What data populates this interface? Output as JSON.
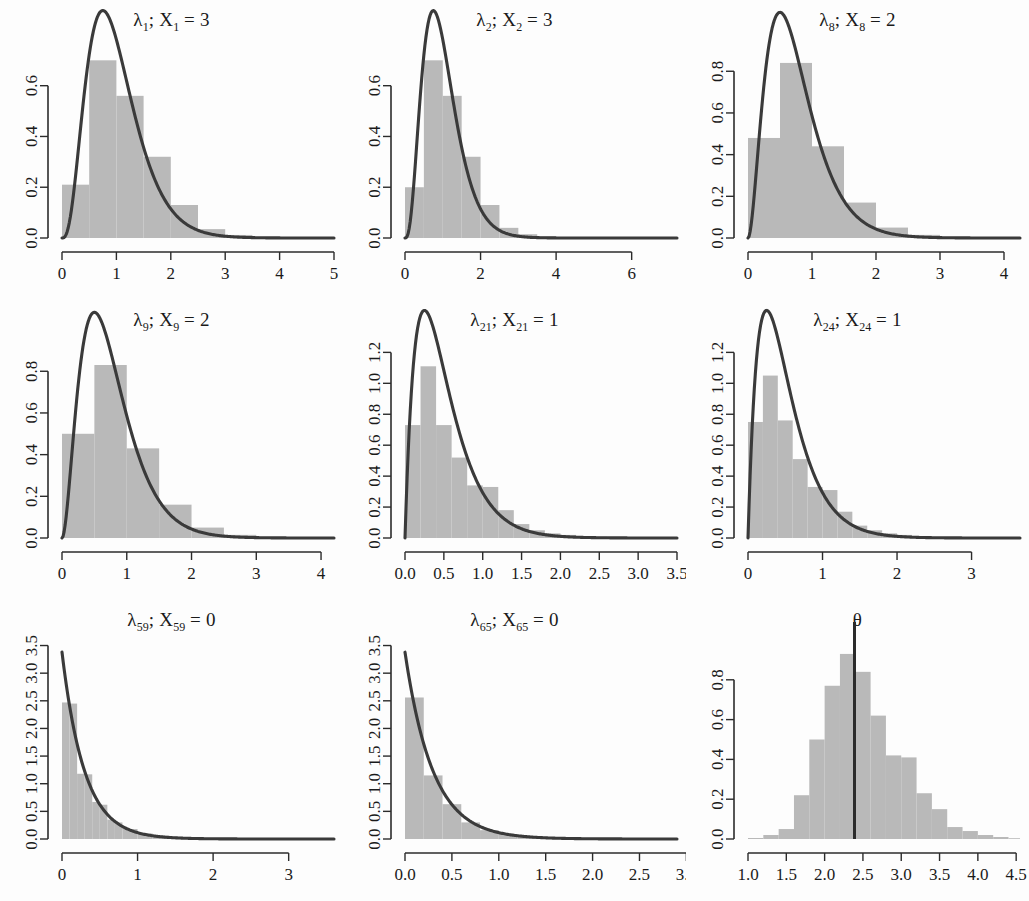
{
  "figure": {
    "title": "",
    "rows": 3,
    "cols": 3,
    "background_color": "#fdfdfd",
    "bar_fill_color": "#b9b9b9",
    "curve_color": "#3a3a3a",
    "axis_color": "#2b2b2b"
  },
  "panels": [
    {
      "id": "panel-lambda-1",
      "title_symbol": "λ",
      "title_sub1": "1",
      "title_var": "X",
      "title_sub2": "1",
      "title_value": "3",
      "title_text": "λ1; X1 = 3"
    },
    {
      "id": "panel-lambda-2",
      "title_symbol": "λ",
      "title_sub1": "2",
      "title_var": "X",
      "title_sub2": "2",
      "title_value": "3",
      "title_text": "λ2; X2 = 3"
    },
    {
      "id": "panel-lambda-8",
      "title_symbol": "λ",
      "title_sub1": "8",
      "title_var": "X",
      "title_sub2": "8",
      "title_value": "2",
      "title_text": "λ8; X8 = 2"
    },
    {
      "id": "panel-lambda-9",
      "title_symbol": "λ",
      "title_sub1": "9",
      "title_var": "X",
      "title_sub2": "9",
      "title_value": "2",
      "title_text": "λ9; X9 = 2"
    },
    {
      "id": "panel-lambda-21",
      "title_symbol": "λ",
      "title_sub1": "21",
      "title_var": "X",
      "title_sub2": "21",
      "title_value": "1",
      "title_text": "λ21; X21 = 1"
    },
    {
      "id": "panel-lambda-24",
      "title_symbol": "λ",
      "title_sub1": "24",
      "title_var": "X",
      "title_sub2": "24",
      "title_value": "1",
      "title_text": "λ24; X24 = 1"
    },
    {
      "id": "panel-lambda-59",
      "title_symbol": "λ",
      "title_sub1": "59",
      "title_var": "X",
      "title_sub2": "59",
      "title_value": "0",
      "title_text": "λ59; X59 = 0"
    },
    {
      "id": "panel-lambda-65",
      "title_symbol": "λ",
      "title_sub1": "65",
      "title_var": "X",
      "title_sub2": "65",
      "title_value": "0",
      "title_text": "λ65; X65 = 0"
    },
    {
      "id": "panel-theta",
      "title_symbol": "θ",
      "title_sub1": "",
      "title_var": "",
      "title_sub2": "",
      "title_value": "",
      "title_text": "θ"
    }
  ],
  "chart_data": [
    {
      "type": "bar",
      "id": "panel-lambda-1",
      "title": "λ1; X1 = 3",
      "xlabel": "",
      "ylabel": "",
      "xlim": [
        0,
        5.0
      ],
      "ylim": [
        0,
        0.78
      ],
      "xticks": [
        0,
        1,
        2,
        3,
        4,
        5
      ],
      "xticklabels": [
        "0",
        "1",
        "2",
        "3",
        "4",
        "5"
      ],
      "yticks": [
        0.0,
        0.2,
        0.4,
        0.6
      ],
      "yticklabels": [
        "0.0",
        "0.2",
        "0.4",
        "0.6"
      ],
      "grid": false,
      "bin_edges": [
        0.0,
        0.5,
        1.0,
        1.5,
        2.0,
        2.5,
        3.0,
        3.5,
        4.0,
        4.5,
        5.0
      ],
      "values": [
        0.21,
        0.7,
        0.56,
        0.32,
        0.13,
        0.035,
        0.012,
        0.004,
        0.001,
        0.0
      ],
      "overlay": {
        "name": "gamma density",
        "type": "line",
        "shape": 4,
        "rate": 4,
        "peak_x": 0.86,
        "peak_y": 0.75
      }
    },
    {
      "type": "bar",
      "id": "panel-lambda-2",
      "title": "λ2; X2 = 3",
      "xlabel": "",
      "ylabel": "",
      "xlim": [
        0,
        7.2
      ],
      "ylim": [
        0,
        0.78
      ],
      "xticks": [
        0,
        2,
        4,
        6
      ],
      "xticklabels": [
        "0",
        "2",
        "4",
        "6"
      ],
      "yticks": [
        0.0,
        0.2,
        0.4,
        0.6
      ],
      "yticklabels": [
        "0.0",
        "0.2",
        "0.4",
        "0.6"
      ],
      "grid": false,
      "bin_edges": [
        0.0,
        0.5,
        1.0,
        1.5,
        2.0,
        2.5,
        3.0,
        3.5,
        4.0,
        4.5,
        5.0,
        5.5,
        6.0,
        6.5,
        7.0
      ],
      "values": [
        0.2,
        0.7,
        0.56,
        0.32,
        0.13,
        0.04,
        0.015,
        0.006,
        0.002,
        0.001,
        0.0,
        0.0,
        0.0,
        0.0
      ],
      "overlay": {
        "name": "gamma density",
        "type": "line",
        "shape": 4,
        "rate": 4,
        "peak_x": 0.88,
        "peak_y": 0.75
      }
    },
    {
      "type": "bar",
      "id": "panel-lambda-8",
      "title": "λ8; X8 = 2",
      "xlabel": "",
      "ylabel": "",
      "xlim": [
        0,
        4.25
      ],
      "ylim": [
        0,
        0.95
      ],
      "xticks": [
        0,
        1,
        2,
        3,
        4
      ],
      "xticklabels": [
        "0",
        "1",
        "2",
        "3",
        "4"
      ],
      "yticks": [
        0.0,
        0.2,
        0.4,
        0.6,
        0.8
      ],
      "yticklabels": [
        "0.0",
        "0.2",
        "0.4",
        "0.6",
        "0.8"
      ],
      "grid": false,
      "bin_edges": [
        0.0,
        0.5,
        1.0,
        1.5,
        2.0,
        2.5,
        3.0,
        3.5,
        4.0,
        4.25
      ],
      "values": [
        0.48,
        0.84,
        0.44,
        0.17,
        0.05,
        0.015,
        0.005,
        0.001,
        0.0
      ],
      "overlay": {
        "name": "gamma density",
        "type": "line",
        "shape": 3,
        "rate": 4,
        "peak_x": 0.58,
        "peak_y": 0.92
      }
    },
    {
      "type": "bar",
      "id": "panel-lambda-9",
      "title": "λ9; X9 = 2",
      "xlabel": "",
      "ylabel": "",
      "xlim": [
        0,
        4.2
      ],
      "ylim": [
        0,
        0.95
      ],
      "xticks": [
        0,
        1,
        2,
        3,
        4
      ],
      "xticklabels": [
        "0",
        "1",
        "2",
        "3",
        "4"
      ],
      "yticks": [
        0.0,
        0.2,
        0.4,
        0.6,
        0.8
      ],
      "yticklabels": [
        "0.0",
        "0.2",
        "0.4",
        "0.6",
        "0.8"
      ],
      "grid": false,
      "bin_edges": [
        0.0,
        0.5,
        1.0,
        1.5,
        2.0,
        2.5,
        3.0,
        3.5,
        4.0,
        4.2
      ],
      "values": [
        0.5,
        0.83,
        0.43,
        0.16,
        0.05,
        0.015,
        0.004,
        0.001,
        0.0
      ],
      "overlay": {
        "name": "gamma density",
        "type": "line",
        "shape": 3,
        "rate": 4,
        "peak_x": 0.6,
        "peak_y": 0.92
      }
    },
    {
      "type": "bar",
      "id": "panel-lambda-21",
      "title": "λ21; X21 = 1",
      "xlabel": "",
      "ylabel": "",
      "xlim": [
        0,
        3.5
      ],
      "ylim": [
        0,
        1.28
      ],
      "xticks": [
        0.0,
        0.5,
        1.0,
        1.5,
        2.0,
        2.5,
        3.0,
        3.5
      ],
      "xticklabels": [
        "0.0",
        "0.5",
        "1.0",
        "1.5",
        "2.0",
        "2.5",
        "3.0",
        "3.5"
      ],
      "yticks": [
        0.0,
        0.2,
        0.4,
        0.6,
        0.8,
        1.0,
        1.2
      ],
      "yticklabels": [
        "0.0",
        "0.2",
        "0.4",
        "0.6",
        "0.8",
        "1.0",
        "1.2"
      ],
      "grid": false,
      "bin_edges": [
        0.0,
        0.2,
        0.4,
        0.6,
        0.8,
        1.0,
        1.2,
        1.4,
        1.6,
        1.8,
        2.0,
        2.2,
        2.4,
        2.6,
        2.8,
        3.0,
        3.2
      ],
      "values": [
        0.73,
        1.11,
        0.73,
        0.52,
        0.34,
        0.33,
        0.18,
        0.09,
        0.05,
        0.03,
        0.02,
        0.01,
        0.008,
        0.004,
        0.002,
        0.001
      ],
      "overlay": {
        "name": "gamma density",
        "type": "line",
        "shape": 2,
        "rate": 4,
        "peak_x": 0.31,
        "peak_y": 1.24
      }
    },
    {
      "type": "bar",
      "id": "panel-lambda-24",
      "title": "λ24; X24 = 1",
      "xlabel": "",
      "ylabel": "",
      "xlim": [
        0,
        3.65
      ],
      "ylim": [
        0,
        1.28
      ],
      "xticks": [
        0,
        1,
        2,
        3
      ],
      "xticklabels": [
        "0",
        "1",
        "2",
        "3"
      ],
      "yticks": [
        0.0,
        0.2,
        0.4,
        0.6,
        0.8,
        1.0,
        1.2
      ],
      "yticklabels": [
        "0.0",
        "0.2",
        "0.4",
        "0.6",
        "0.8",
        "1.0",
        "1.2"
      ],
      "grid": false,
      "bin_edges": [
        0.0,
        0.2,
        0.4,
        0.6,
        0.8,
        1.0,
        1.2,
        1.4,
        1.6,
        1.8,
        2.0,
        2.2,
        2.4,
        2.6,
        2.8,
        3.0,
        3.2,
        3.4,
        3.65
      ],
      "values": [
        0.75,
        1.05,
        0.76,
        0.51,
        0.33,
        0.31,
        0.17,
        0.08,
        0.05,
        0.03,
        0.02,
        0.012,
        0.006,
        0.003,
        0.002,
        0.001,
        0.0,
        0.0
      ],
      "overlay": {
        "name": "gamma density",
        "type": "line",
        "shape": 2,
        "rate": 4,
        "peak_x": 0.3,
        "peak_y": 1.24
      }
    },
    {
      "type": "bar",
      "id": "panel-lambda-59",
      "title": "λ59; X59 = 0",
      "xlabel": "",
      "ylabel": "",
      "xlim": [
        0,
        3.6
      ],
      "ylim": [
        0,
        3.6
      ],
      "xticks": [
        0,
        1,
        2,
        3
      ],
      "xticklabels": [
        "0",
        "1",
        "2",
        "3"
      ],
      "yticks": [
        0.0,
        0.5,
        1.0,
        1.5,
        2.0,
        2.5,
        3.0,
        3.5
      ],
      "yticklabels": [
        "0.0",
        "0.5",
        "1.0",
        "1.5",
        "2.0",
        "2.5",
        "3.0",
        "3.5"
      ],
      "grid": false,
      "bin_edges": [
        0.0,
        0.1,
        0.2,
        0.3,
        0.4,
        0.5,
        0.6,
        0.7,
        0.8,
        0.9,
        1.0,
        1.2,
        1.4,
        1.6,
        1.8,
        2.0,
        2.5,
        3.0,
        3.6
      ],
      "values": [
        2.47,
        2.45,
        1.18,
        1.17,
        0.67,
        0.62,
        0.35,
        0.3,
        0.2,
        0.18,
        0.1,
        0.06,
        0.04,
        0.02,
        0.012,
        0.006,
        0.002,
        0.0
      ],
      "overlay": {
        "name": "exponential density",
        "type": "line",
        "shape": 1,
        "rate": 3.38,
        "peak_x": 0.0,
        "peak_y": 3.38
      }
    },
    {
      "type": "bar",
      "id": "panel-lambda-65",
      "title": "λ65; X65 = 0",
      "xlabel": "",
      "ylabel": "",
      "xlim": [
        0,
        2.9
      ],
      "ylim": [
        0,
        3.6
      ],
      "xticks": [
        0.0,
        0.5,
        1.0,
        1.5,
        2.0,
        2.5,
        3.0
      ],
      "xticklabels": [
        "0.0",
        "0.5",
        "1.0",
        "1.5",
        "2.0",
        "2.5",
        "3.0"
      ],
      "yticks": [
        0.0,
        0.5,
        1.0,
        1.5,
        2.0,
        2.5,
        3.0,
        3.5
      ],
      "yticklabels": [
        "0.0",
        "0.5",
        "1.0",
        "1.5",
        "2.0",
        "2.5",
        "3.0",
        "3.5"
      ],
      "grid": false,
      "bin_edges": [
        0.0,
        0.2,
        0.4,
        0.6,
        0.8,
        1.0,
        1.2,
        1.4,
        1.6,
        1.8,
        2.0,
        2.2,
        2.4,
        2.6,
        2.9
      ],
      "values": [
        2.56,
        1.15,
        0.63,
        0.3,
        0.16,
        0.09,
        0.05,
        0.025,
        0.014,
        0.008,
        0.004,
        0.002,
        0.001,
        0.0
      ],
      "overlay": {
        "name": "exponential density",
        "type": "line",
        "shape": 1,
        "rate": 3.38,
        "peak_x": 0.0,
        "peak_y": 3.38
      }
    },
    {
      "type": "bar",
      "id": "panel-theta",
      "title": "θ",
      "xlabel": "",
      "ylabel": "",
      "xlim": [
        1.0,
        4.55
      ],
      "ylim": [
        0,
        1.0
      ],
      "xticks": [
        1.0,
        1.5,
        2.0,
        2.5,
        3.0,
        3.5,
        4.0,
        4.5
      ],
      "xticklabels": [
        "1.0",
        "1.5",
        "2.0",
        "2.5",
        "3.0",
        "3.5",
        "4.0",
        "4.5"
      ],
      "yticks": [
        0.0,
        0.2,
        0.4,
        0.6,
        0.8
      ],
      "yticklabels": [
        "0.0",
        "0.2",
        "0.4",
        "0.6",
        "0.8"
      ],
      "grid": false,
      "bin_edges": [
        1.0,
        1.2,
        1.4,
        1.6,
        1.8,
        2.0,
        2.2,
        2.4,
        2.6,
        2.8,
        3.0,
        3.2,
        3.4,
        3.6,
        3.8,
        4.0,
        4.2,
        4.4,
        4.55
      ],
      "values": [
        0.005,
        0.02,
        0.05,
        0.22,
        0.5,
        0.77,
        0.93,
        0.84,
        0.62,
        0.42,
        0.41,
        0.23,
        0.15,
        0.06,
        0.04,
        0.02,
        0.01,
        0.004
      ],
      "overlay": {
        "name": "reference line",
        "type": "vline",
        "x": 2.39
      }
    }
  ]
}
